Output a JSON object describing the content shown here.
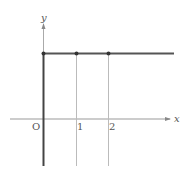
{
  "diagram": {
    "type": "function-graph",
    "axes": {
      "x_label": "x",
      "y_label": "y",
      "origin_label": "O"
    },
    "ticks": [
      {
        "label": "1",
        "x": 1
      },
      {
        "label": "2",
        "x": 2
      }
    ],
    "graph": {
      "description": "Thick vertical segment along the y-axis below the level line, then horizontal line at constant height extending right",
      "points": [
        {
          "x": 0,
          "label": ""
        },
        {
          "x": 1,
          "label": ""
        },
        {
          "x": 2,
          "label": ""
        }
      ]
    },
    "colors": {
      "graph": "#444444",
      "axis": "#999999",
      "guide": "#bbbbbb",
      "label": "#555555"
    }
  }
}
